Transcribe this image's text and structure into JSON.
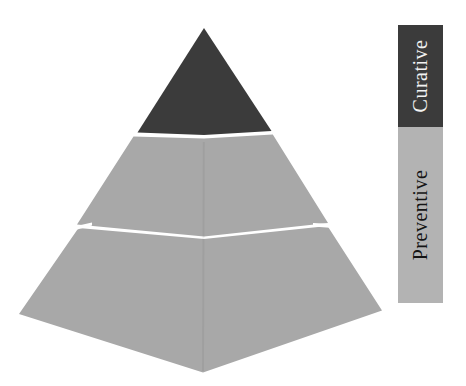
{
  "canvas": {
    "width": 466,
    "height": 386,
    "background": "#ffffff"
  },
  "pyramid": {
    "type": "pyramid",
    "tiers": [
      {
        "name": "curative-apex",
        "label": "Curative",
        "color": "#3b3b3b"
      },
      {
        "name": "preventive-middle",
        "label": "Preventive",
        "color": "#a8a8a8"
      },
      {
        "name": "preventive-base",
        "label": "Preventive",
        "color": "#a8a8a8"
      }
    ],
    "separator_color": "#ffffff"
  },
  "legend": {
    "orientation": "vertical",
    "items": [
      {
        "label": "Curative",
        "background": "#3b3b3b",
        "text_color": "#f2f2f2"
      },
      {
        "label": "Preventive",
        "background": "#b3b3b3",
        "text_color": "#141414"
      }
    ]
  }
}
